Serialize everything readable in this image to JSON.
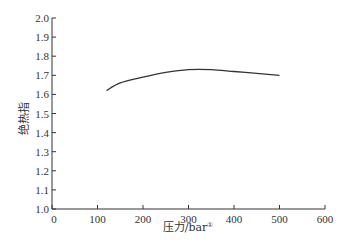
{
  "chart_data": {
    "type": "line",
    "title": "",
    "xlabel": "压力/bar",
    "xlabel_sup": "①",
    "ylabel": "绝热指",
    "xlim": [
      0,
      600
    ],
    "ylim": [
      1.0,
      2.0
    ],
    "xticks": [
      0,
      100,
      200,
      300,
      400,
      500,
      600
    ],
    "yticks": [
      1.0,
      1.1,
      1.2,
      1.3,
      1.4,
      1.5,
      1.6,
      1.7,
      1.8,
      1.9,
      2.0
    ],
    "xtick_labels": [
      "0",
      "100",
      "200",
      "300",
      "400",
      "500",
      "600"
    ],
    "ytick_labels": [
      "1.0",
      "1.1",
      "1.2",
      "1.3",
      "1.4",
      "1.5",
      "1.6",
      "1.7",
      "1.8",
      "1.9",
      "2.0"
    ],
    "grid": false,
    "legend": null,
    "series": [
      {
        "name": "绝热指数",
        "x": [
          120,
          150,
          200,
          250,
          300,
          350,
          400,
          450,
          500
        ],
        "y": [
          1.62,
          1.66,
          1.69,
          1.715,
          1.73,
          1.73,
          1.72,
          1.71,
          1.7
        ],
        "color": "#333333"
      }
    ]
  }
}
